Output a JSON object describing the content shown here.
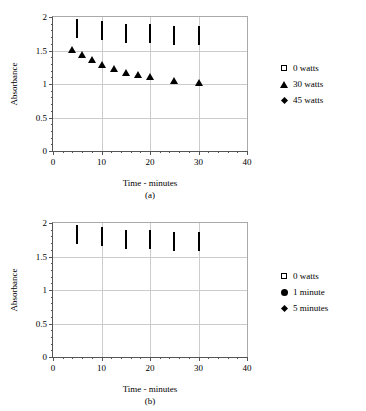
{
  "figure": {
    "panels": [
      {
        "id": "a",
        "caption": "(a)",
        "xlabel": "Time - minutes",
        "ylabel": "Absorbance"
      },
      {
        "id": "b",
        "caption": "(b)",
        "xlabel": "Time - minutes",
        "ylabel": "Absorbance"
      }
    ]
  },
  "axis": {
    "xticks": [
      "0",
      "10",
      "20",
      "30",
      "40"
    ],
    "yticks": [
      "0",
      "0.5",
      "1",
      "1.5",
      "2"
    ]
  },
  "chart_data": [
    {
      "type": "scatter",
      "title": "(a)",
      "xlabel": "Time - minutes",
      "ylabel": "Absorbance",
      "xlim": [
        0,
        40
      ],
      "ylim": [
        0,
        2
      ],
      "xticks": [
        0,
        10,
        20,
        30,
        40
      ],
      "yticks": [
        0,
        0.5,
        1,
        1.5,
        2
      ],
      "grid": "horizontal-and-vertical-major",
      "legend_position": "right-outside",
      "series": [
        {
          "name": "0 watts",
          "marker": "open-square",
          "color": "#000000",
          "points": [
            {
              "x": 5,
              "y": 1.82
            },
            {
              "x": 10,
              "y": 1.79
            },
            {
              "x": 15,
              "y": 1.75
            },
            {
              "x": 20,
              "y": 1.74
            },
            {
              "x": 25,
              "y": 1.72
            },
            {
              "x": 30,
              "y": 1.72
            }
          ]
        },
        {
          "name": "30 watts",
          "marker": "filled-triangle",
          "color": "#000000",
          "points": [
            {
              "x": 4,
              "y": 1.69
            },
            {
              "x": 6,
              "y": 1.61
            },
            {
              "x": 8,
              "y": 1.53
            },
            {
              "x": 10,
              "y": 1.47
            },
            {
              "x": 12.5,
              "y": 1.4
            },
            {
              "x": 15,
              "y": 1.35
            },
            {
              "x": 17.5,
              "y": 1.31
            },
            {
              "x": 20,
              "y": 1.28
            },
            {
              "x": 25,
              "y": 1.23
            },
            {
              "x": 30,
              "y": 1.2
            }
          ]
        },
        {
          "name": "45 watts",
          "marker": "filled-diamond",
          "color": "#000000",
          "points": [
            {
              "x": 4,
              "y": 1.46
            },
            {
              "x": 6,
              "y": 1.37
            },
            {
              "x": 8,
              "y": 1.32
            },
            {
              "x": 10,
              "y": 1.28
            },
            {
              "x": 12.5,
              "y": 1.24
            },
            {
              "x": 15,
              "y": 1.2
            },
            {
              "x": 17.5,
              "y": 1.16
            },
            {
              "x": 20,
              "y": 1.14
            },
            {
              "x": 25,
              "y": 1.08
            },
            {
              "x": 30,
              "y": 1.05
            }
          ]
        }
      ]
    },
    {
      "type": "scatter",
      "title": "(b)",
      "xlabel": "Time - minutes",
      "ylabel": "Absorbance",
      "xlim": [
        0,
        40
      ],
      "ylim": [
        0,
        2
      ],
      "xticks": [
        0,
        10,
        20,
        30,
        40
      ],
      "yticks": [
        0,
        0.5,
        1,
        1.5,
        2
      ],
      "grid": "horizontal-and-vertical-major",
      "legend_position": "right-outside",
      "series": [
        {
          "name": "0 watts",
          "marker": "open-square",
          "color": "#000000",
          "points": [
            {
              "x": 5,
              "y": 1.82
            },
            {
              "x": 10,
              "y": 1.79
            },
            {
              "x": 15,
              "y": 1.75
            },
            {
              "x": 20,
              "y": 1.74
            },
            {
              "x": 25,
              "y": 1.72
            },
            {
              "x": 30,
              "y": 1.72
            }
          ]
        },
        {
          "name": "1 minute",
          "marker": "filled-circle",
          "color": "#000000",
          "points": [
            {
              "x": 2,
              "y": 1.79
            },
            {
              "x": 5,
              "y": 1.73
            },
            {
              "x": 7.5,
              "y": 1.69
            },
            {
              "x": 10,
              "y": 1.66
            },
            {
              "x": 12.5,
              "y": 1.63
            },
            {
              "x": 15,
              "y": 1.61
            },
            {
              "x": 17.5,
              "y": 1.6
            },
            {
              "x": 20,
              "y": 1.59
            },
            {
              "x": 25,
              "y": 1.57
            },
            {
              "x": 30,
              "y": 1.55
            }
          ]
        },
        {
          "name": "5 minutes",
          "marker": "filled-diamond",
          "color": "#000000",
          "points": [
            {
              "x": 7,
              "y": 1.5
            },
            {
              "x": 8,
              "y": 1.45
            },
            {
              "x": 10,
              "y": 1.37
            },
            {
              "x": 12.5,
              "y": 1.3
            },
            {
              "x": 15,
              "y": 1.25
            },
            {
              "x": 17.5,
              "y": 1.22
            },
            {
              "x": 20,
              "y": 1.19
            },
            {
              "x": 25,
              "y": 1.14
            },
            {
              "x": 30,
              "y": 1.11
            }
          ]
        }
      ]
    }
  ]
}
